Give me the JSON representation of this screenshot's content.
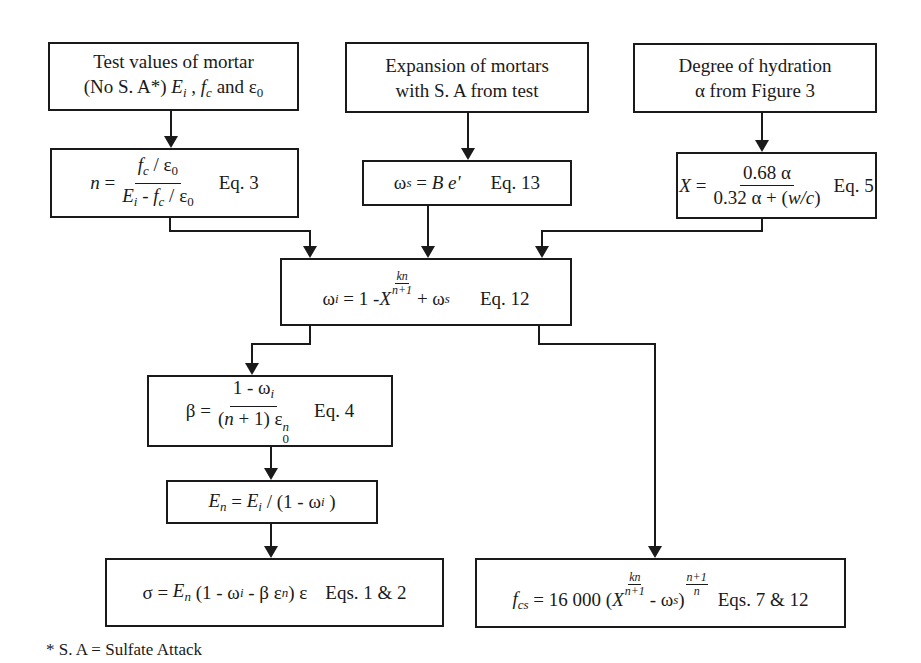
{
  "diagram": {
    "type": "flowchart",
    "inputs": {
      "test_values": {
        "line1": "Test values of mortar",
        "line2_prefix": "(No S. A*) ",
        "vars": [
          "E",
          "i",
          "f",
          "c",
          "ε",
          "0"
        ],
        "and": "and"
      },
      "expansion": {
        "line1": "Expansion of mortars",
        "line2": "with S. A from test"
      },
      "hydration": {
        "line1": "Degree of hydration",
        "line2": "α from Figure 3"
      }
    },
    "equations": {
      "eq3": {
        "lhs": "n =",
        "num": "f_c / ε_0",
        "den": "E_i - f_c / ε_0",
        "label": "Eq. 3"
      },
      "eq13": {
        "lhs": "ω",
        "lhs_sub": "s",
        "rhs": "= B e'",
        "label": "Eq. 13"
      },
      "eq5": {
        "lhs": "X =",
        "num": "0.68 α",
        "den_a": "0.32 α + (",
        "den_b": "w/c",
        "den_c": ")",
        "label": "Eq. 5"
      },
      "eq12": {
        "lhs": "ω",
        "lhs_sub": "i",
        "mid": "= 1 - X",
        "exp_num": "kn",
        "exp_den": "n+1",
        "tail": "+ ω",
        "tail_sub": "s",
        "label": "Eq. 12"
      },
      "eq4": {
        "lhs": "β =",
        "num": "1 - ω",
        "num_sub": "i",
        "den_a": "(n + 1) ε",
        "den_sub": "0",
        "den_sup": "n",
        "label": "Eq. 4"
      },
      "en": {
        "text": "E_n = E_i / (1 - ω_i)"
      },
      "eq1_2": {
        "text": "σ = E_n (1 - ω_i - β ε^n) ε",
        "label": "Eqs. 1 & 2"
      },
      "eq7_12": {
        "lhs": "f",
        "lhs_sub": "cs",
        "coef": "= 16 000 (X",
        "exp1_num": "kn",
        "exp1_den": "n+1",
        "mid": "- ω",
        "mid_sub": "s",
        "close": ")",
        "exp2_num": "n+1",
        "exp2_den": "n",
        "label": "Eqs. 7 & 12"
      }
    },
    "footnote": "* S. A = Sulfate Attack"
  }
}
